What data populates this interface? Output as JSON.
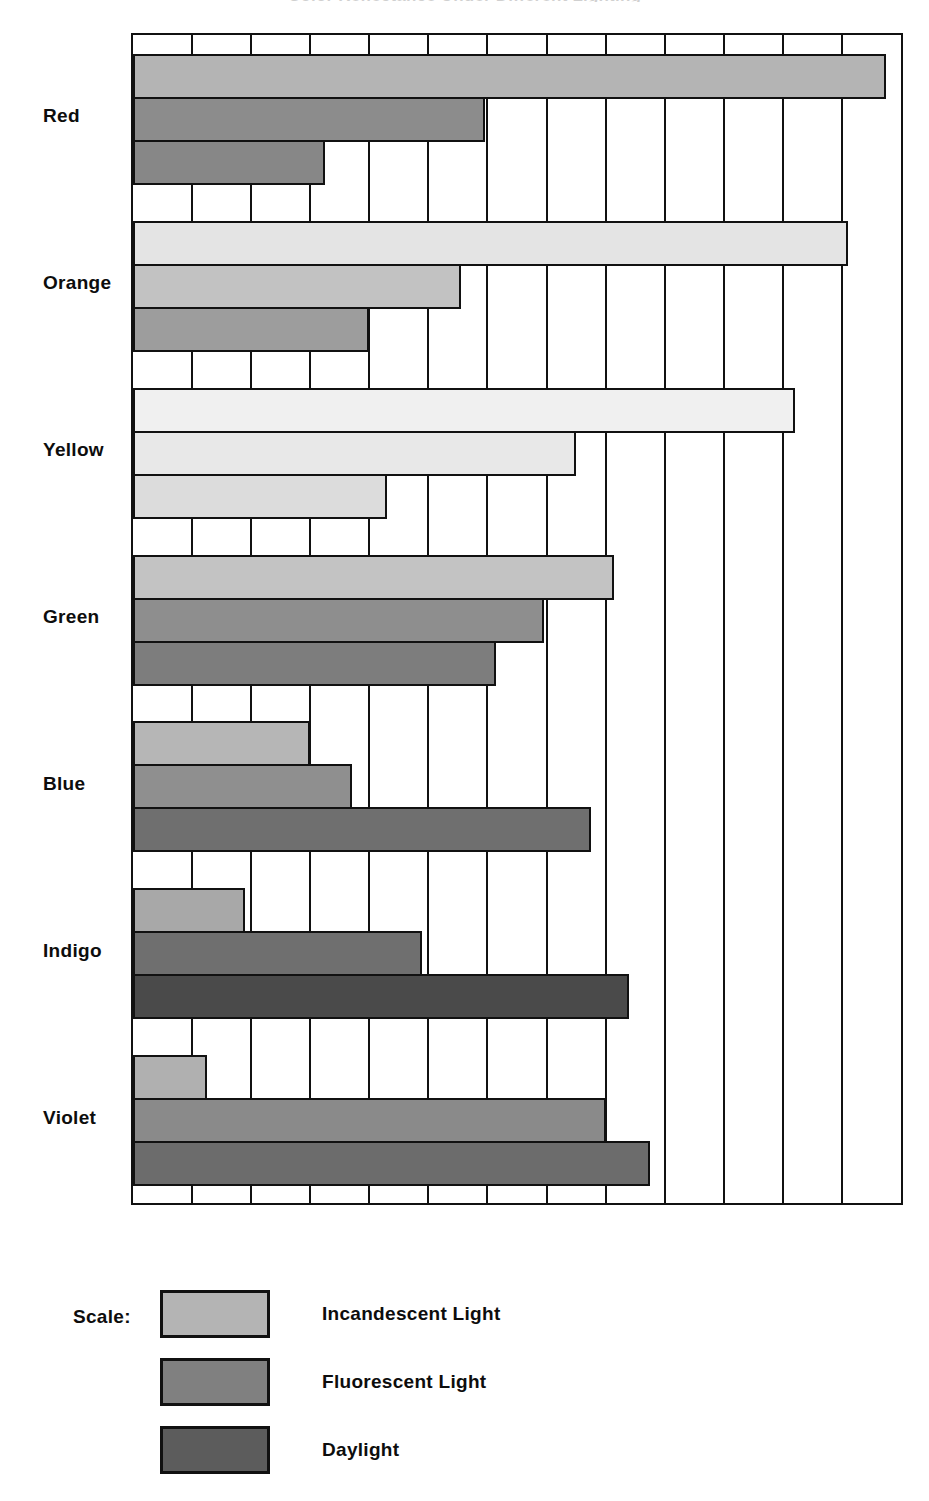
{
  "chart_data": {
    "type": "bar",
    "orientation": "horizontal",
    "title": "Color Reflectance Under Different Lighting",
    "xlabel": "",
    "ylabel": "",
    "categories": [
      "Red",
      "Orange",
      "Yellow",
      "Green",
      "Blue",
      "Indigo",
      "Violet"
    ],
    "xlim": [
      0,
      13
    ],
    "xticks": [
      0,
      1,
      2,
      3,
      4,
      5,
      6,
      7,
      8,
      9,
      10,
      11,
      12,
      13
    ],
    "xticklabels": [
      "",
      "",
      "",
      "",
      "",
      "",
      "",
      "",
      "",
      "",
      "",
      "",
      "",
      ""
    ],
    "grid": true,
    "legend_position": "below",
    "legend_title": "Scale:",
    "series": [
      {
        "name": "Incandescent Light",
        "color": "#b4b4b4",
        "values": [
          12.75,
          12.1,
          11.2,
          8.15,
          3.0,
          1.9,
          1.25
        ]
      },
      {
        "name": "Fluorescent Light",
        "color": "#808080",
        "values": [
          5.95,
          5.55,
          7.5,
          6.95,
          3.7,
          4.9,
          8.0
        ]
      },
      {
        "name": "Daylight",
        "color": "#5c5c5c",
        "values": [
          3.25,
          4.0,
          4.3,
          6.15,
          7.75,
          8.4,
          8.75
        ]
      }
    ],
    "bar_fills": {
      "Red": [
        "#b4b4b4",
        "#8c8c8c",
        "#878787"
      ],
      "Orange": [
        "#e4e4e4",
        "#c2c2c2",
        "#9d9d9d"
      ],
      "Yellow": [
        "#f0f0f0",
        "#e8e8e8",
        "#dcdcdc"
      ],
      "Green": [
        "#c3c3c3",
        "#8e8e8e",
        "#7d7d7d"
      ],
      "Blue": [
        "#b6b6b6",
        "#8f8f8f",
        "#6f6f6f"
      ],
      "Indigo": [
        "#a8a8a8",
        "#6f6f6f",
        "#4a4a4a"
      ],
      "Violet": [
        "#b0b0b0",
        "#8a8a8a",
        "#6c6c6c"
      ]
    }
  },
  "legend": {
    "title": "Scale:",
    "entries": [
      {
        "label": "Incandescent Light",
        "color": "#b4b4b4"
      },
      {
        "label": "Fluorescent Light",
        "color": "#808080"
      },
      {
        "label": "Daylight",
        "color": "#5c5c5c"
      }
    ]
  }
}
